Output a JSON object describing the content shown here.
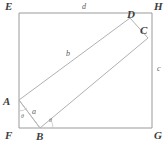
{
  "figure": {
    "kind": "geometry-diagram",
    "colors": {
      "background": "#ffffff",
      "outer_stroke": "#9a9a9a",
      "inner_stroke": "#b0b0b0",
      "helper_stroke": "#b8b8b8",
      "label_text": "#3d3d3d",
      "side_label_text": "#5a5a5a",
      "angle_label_text": "#6a6a6a"
    },
    "outer_rectangle": {
      "name": "EFGH",
      "vertices": [
        {
          "label": "E",
          "x": 19,
          "y": 13,
          "lx": 5,
          "ly": 1
        },
        {
          "label": "H",
          "x": 152,
          "y": 13,
          "lx": 154,
          "ly": 1
        },
        {
          "label": "G",
          "x": 152,
          "y": 128,
          "lx": 154,
          "ly": 130
        },
        {
          "label": "F",
          "x": 19,
          "y": 128,
          "lx": 5,
          "ly": 130
        }
      ]
    },
    "inner_rectangle": {
      "name": "ABCD",
      "vertices": [
        {
          "label": "A",
          "x": 19,
          "y": 100,
          "lx": 3,
          "ly": 96
        },
        {
          "label": "B",
          "x": 40,
          "y": 128,
          "lx": 36,
          "ly": 131
        },
        {
          "label": "C",
          "x": 148,
          "y": 38,
          "lx": 140,
          "ly": 25
        },
        {
          "label": "D",
          "x": 130,
          "y": 18,
          "lx": 127,
          "ly": 9
        }
      ]
    },
    "side_labels": [
      {
        "name": "d",
        "text": "d",
        "x": 82,
        "y": 3,
        "edge": "EH (top of outer rectangle)"
      },
      {
        "name": "c",
        "text": "c",
        "x": 157,
        "y": 65,
        "edge": "HG (right of outer rectangle)"
      },
      {
        "name": "b",
        "text": "b",
        "x": 66,
        "y": 50,
        "edge": "AD (long side of inner rectangle)"
      },
      {
        "name": "a",
        "text": "a",
        "x": 32,
        "y": 108,
        "edge": "AB (short side of inner rectangle)"
      }
    ],
    "angle_labels": [
      {
        "name": "theta-at-a",
        "text": "θ",
        "x": 21,
        "y": 113,
        "at": "A, between AF and AB"
      },
      {
        "name": "theta-at-b",
        "text": "θ",
        "x": 49,
        "y": 117,
        "at": "B, between BF and BC"
      }
    ],
    "helper_lines": [
      {
        "from": "A",
        "to": "B",
        "note": "short side of inner rectangle, forms triangle ABF with corner F"
      }
    ]
  }
}
